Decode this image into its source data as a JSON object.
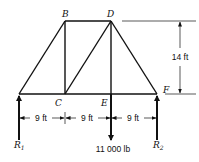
{
  "diagram": {
    "type": "truss",
    "joints": {
      "B": {
        "label": "B"
      },
      "C": {
        "label": "C"
      },
      "D": {
        "label": "D"
      },
      "E": {
        "label": "E"
      },
      "F": {
        "label": "F"
      }
    },
    "members": [
      [
        "A",
        "B"
      ],
      [
        "B",
        "D"
      ],
      [
        "D",
        "F"
      ],
      [
        "A",
        "C"
      ],
      [
        "C",
        "E"
      ],
      [
        "E",
        "F"
      ],
      [
        "B",
        "C"
      ],
      [
        "C",
        "D"
      ],
      [
        "D",
        "E"
      ]
    ],
    "dimensions": {
      "height": "14 ft",
      "spans": [
        "9 ft",
        "9 ft",
        "9 ft"
      ]
    },
    "loads": {
      "applied": "11 000 lb",
      "reaction_left": {
        "main": "R",
        "sub": "1"
      },
      "reaction_right": {
        "main": "R",
        "sub": "2"
      }
    }
  }
}
